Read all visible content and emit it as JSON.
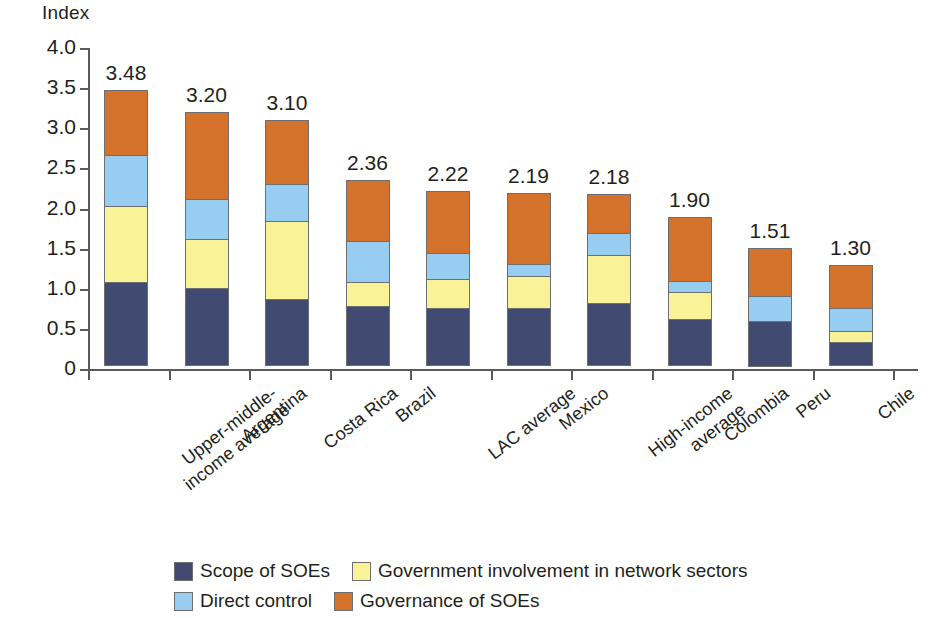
{
  "chart_data": {
    "type": "bar",
    "subtype": "stacked-vertical",
    "title": "",
    "ylabel": "Index",
    "xlabel": "",
    "ylim": [
      0,
      4.0
    ],
    "ytick_labels": [
      "4.0",
      "3.5",
      "3.0",
      "2.5",
      "2.0",
      "1.5",
      "1.0",
      "0.5",
      "0"
    ],
    "ytick_values": [
      4.0,
      3.5,
      3.0,
      2.5,
      2.0,
      1.5,
      1.0,
      0.5,
      0
    ],
    "grid": false,
    "legend_position": "bottom",
    "categories": [
      "Upper-middle-\nincome average",
      "Argentina",
      "Costa Rica",
      "Brazil",
      "LAC average",
      "Mexico",
      "High-income\naverage",
      "Colombia",
      "Peru",
      "Chile"
    ],
    "totals": [
      3.48,
      3.2,
      3.1,
      2.36,
      2.22,
      2.19,
      2.18,
      1.9,
      1.51,
      1.3
    ],
    "total_labels": [
      "3.48",
      "3.20",
      "3.10",
      "2.36",
      "2.22",
      "2.19",
      "2.18",
      "1.90",
      "1.51",
      "1.30"
    ],
    "series": [
      {
        "name": "Scope of SOEs",
        "color": "#414b72",
        "values": [
          1.05,
          0.97,
          0.84,
          0.75,
          0.72,
          0.72,
          0.78,
          0.58,
          0.57,
          0.3
        ]
      },
      {
        "name": "Government involvement in network sectors",
        "color": "#faf296",
        "values": [
          0.95,
          0.63,
          0.98,
          0.31,
          0.38,
          0.42,
          0.62,
          0.35,
          0.0,
          0.15
        ]
      },
      {
        "name": "Direct control",
        "color": "#97cdf0",
        "values": [
          0.66,
          0.5,
          0.47,
          0.52,
          0.33,
          0.16,
          0.28,
          0.15,
          0.33,
          0.3
        ]
      },
      {
        "name": "Governance of SOEs",
        "color": "#d4722c",
        "values": [
          0.82,
          1.1,
          0.81,
          0.78,
          0.79,
          0.89,
          0.5,
          0.82,
          0.61,
          0.55
        ]
      }
    ]
  },
  "legend": {
    "items": [
      {
        "label": "Scope of SOEs",
        "color": "#414b72"
      },
      {
        "label": "Government involvement in network sectors",
        "color": "#faf296"
      },
      {
        "label": "Direct control",
        "color": "#97cdf0"
      },
      {
        "label": "Governance of SOEs",
        "color": "#d4722c"
      }
    ]
  }
}
